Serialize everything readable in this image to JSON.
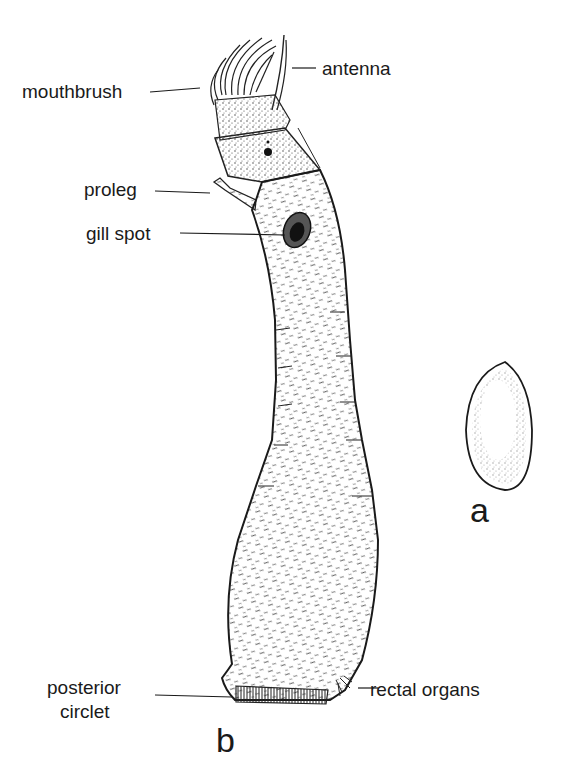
{
  "figure": {
    "panels": [
      {
        "id": "a",
        "label": "a",
        "description": "egg"
      },
      {
        "id": "b",
        "label": "b",
        "description": "larva"
      }
    ]
  },
  "labels": {
    "mouthbrush": "mouthbrush",
    "antenna": "antenna",
    "proleg": "proleg",
    "gill_spot": "gill spot",
    "posterior_line1": "posterior",
    "posterior_line2": "circlet",
    "rectal_organs": "rectal organs",
    "panel_a": "a",
    "panel_b": "b"
  },
  "colors": {
    "ink": "#1a1a1a",
    "background": "#ffffff"
  }
}
